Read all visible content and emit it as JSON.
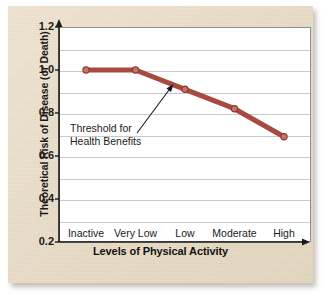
{
  "chart_data": {
    "type": "line",
    "title": "",
    "xlabel": "Levels of Physical Activity",
    "ylabel": "Theoretical Risk of Disease (or Death)",
    "categories": [
      "Inactive",
      "Very Low",
      "Low",
      "Moderate",
      "High"
    ],
    "values": [
      1.0,
      1.0,
      0.91,
      0.82,
      0.69
    ],
    "series": [
      {
        "name": "Theoretical Risk",
        "values": [
          1.0,
          1.0,
          0.91,
          0.82,
          0.69
        ],
        "color": "#A84A40",
        "marker": "circle"
      }
    ],
    "ylim": [
      0.2,
      1.2
    ],
    "yticks": [
      "1.2",
      "1.0",
      "0.8",
      "0.6",
      "0.4",
      "0.2"
    ],
    "ytick_values": [
      1.2,
      1.0,
      0.8,
      0.6,
      0.4,
      0.2
    ],
    "gridlines": [
      1.1,
      1.0,
      0.9,
      0.8,
      0.7,
      0.6,
      0.5,
      0.4,
      0.3
    ],
    "grid": true,
    "legend": "none",
    "annotations": [
      {
        "text_line1": "Threshold for",
        "text_line2": "Health Benefits",
        "points_to_category": "Low",
        "points_to_value": 0.91
      }
    ]
  },
  "figure": {
    "background_color": "#ffffff",
    "card_color": "#ece0cc",
    "plot_background": "#ffffff",
    "axis_color": "#1a1a1a",
    "grid_color": "#c9c9c9",
    "line_color": "#A84A40"
  },
  "axis": {
    "y_label": "Theoretical Risk of Disease (or Death)",
    "x_label": "Levels of Physical Activity"
  },
  "annotation": {
    "line1": "Threshold for",
    "line2": "Health Benefits"
  }
}
